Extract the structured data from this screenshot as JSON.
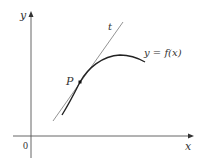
{
  "diagram": {
    "type": "tangent-line-to-curve",
    "axes": {
      "x_label": "x",
      "y_label": "y",
      "origin_label": "0"
    },
    "curve": {
      "label": "y = f(x)"
    },
    "tangent": {
      "label": "t"
    },
    "point": {
      "label": "P"
    },
    "colors": {
      "axes": "#555555",
      "curve": "#222222",
      "tangent": "#666666",
      "text": "#333333"
    }
  }
}
